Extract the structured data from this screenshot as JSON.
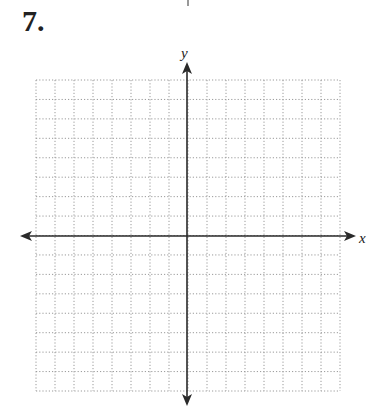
{
  "problem": {
    "number": "7."
  },
  "graph": {
    "x_label": "x",
    "y_label": "y",
    "grid": {
      "columns": 16,
      "rows": 16,
      "style": "dotted"
    },
    "colors": {
      "axis": "#2a2a2a",
      "grid": "#9a9a9a",
      "text": "#222222"
    }
  }
}
